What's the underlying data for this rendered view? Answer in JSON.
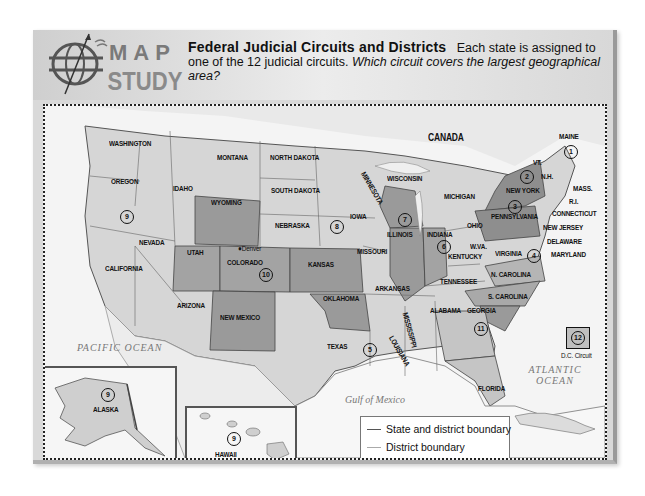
{
  "header": {
    "logo_word1": "MAP",
    "logo_word2": "STUDY",
    "title": "Federal Judicial Circuits and Districts",
    "description": "Each state is assigned to one of the 12 judicial circuits.",
    "question": "Which circuit covers the largest geographical area?"
  },
  "map": {
    "regions": {
      "canada": "CANADA",
      "mexico": "MEXICO",
      "pacific": "PACIFIC OCEAN",
      "atlantic": "ATLANTIC OCEAN",
      "gulf": "Gulf of Mexico"
    },
    "states": {
      "washington": "WASHINGTON",
      "oregon": "OREGON",
      "california": "CALIFORNIA",
      "nevada": "NEVADA",
      "idaho": "IDAHO",
      "montana": "MONTANA",
      "wyoming": "WYOMING",
      "utah": "UTAH",
      "colorado": "COLORADO",
      "arizona": "ARIZONA",
      "new_mexico": "NEW MEXICO",
      "north_dakota": "NORTH DAKOTA",
      "south_dakota": "SOUTH DAKOTA",
      "nebraska": "NEBRASKA",
      "kansas": "KANSAS",
      "oklahoma": "OKLAHOMA",
      "texas": "TEXAS",
      "minnesota": "MINNESOTA",
      "iowa": "IOWA",
      "missouri": "MISSOURI",
      "arkansas": "ARKANSAS",
      "louisiana": "LOUISIANA",
      "wisconsin": "WISCONSIN",
      "illinois": "ILLINOIS",
      "indiana": "INDIANA",
      "michigan": "MICHIGAN",
      "ohio": "OHIO",
      "kentucky": "KENTUCKY",
      "tennessee": "TENNESSEE",
      "mississippi": "MISSISSIPPI",
      "alabama": "ALABAMA",
      "georgia": "GEORGIA",
      "florida": "FLORIDA",
      "s_carolina": "S. CAROLINA",
      "n_carolina": "N. CAROLINA",
      "virginia": "VIRGINIA",
      "w_va": "W.VA.",
      "pennsylvania": "PENNSYLVANIA",
      "new_york": "NEW YORK",
      "vermont": "VT.",
      "new_hampshire": "N.H.",
      "maine": "MAINE",
      "mass": "MASS.",
      "ri": "R.I.",
      "connecticut": "CONNECTICUT",
      "new_jersey": "NEW JERSEY",
      "delaware": "DELAWARE",
      "maryland": "MARYLAND",
      "alaska": "ALASKA",
      "hawaii": "HAWAII"
    },
    "city_denver": "Denver",
    "dc_label": "D.C. Circuit",
    "circuits": {
      "c1": "1",
      "c2": "2",
      "c3": "3",
      "c4": "4",
      "c5": "5",
      "c6": "6",
      "c7": "7",
      "c8": "8",
      "c9": "9",
      "c10": "10",
      "c11": "11",
      "c12": "12",
      "c9_alaska": "9",
      "c9_hawaii": "9"
    }
  },
  "legend": {
    "state_boundary": "State and district boundary",
    "district_boundary": "District boundary",
    "circuit_symbol": "11",
    "judicial_circuits": "Judicial circuits"
  },
  "colors": {
    "light": "#d6d6d6",
    "medium": "#a9a9a9",
    "dark": "#8e8e8e",
    "pale": "#e8e8e8",
    "water": "#f4f4f4"
  }
}
